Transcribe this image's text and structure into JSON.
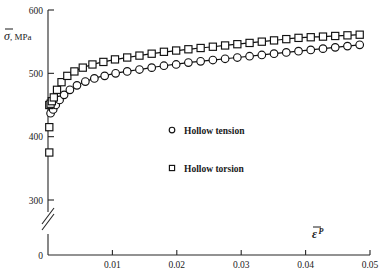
{
  "chart_data": {
    "type": "scatter",
    "title": "",
    "subtitle": "",
    "xlabel": "ε̄",
    "xlabel_superscript": "P",
    "ylabel": "σ̄",
    "ylabel_unit": "MPa",
    "grid": false,
    "legend_position": "center",
    "xlim": [
      0,
      0.05
    ],
    "ylim": [
      300,
      600
    ],
    "y_axis_break": true,
    "y_axis_break_note": "axis broken between 0 and 300",
    "xticks": [
      0.01,
      0.02,
      0.03,
      0.04,
      0.05
    ],
    "xtick_labels": [
      "0.01",
      "0.02",
      "0.03",
      "0.04",
      "0.05"
    ],
    "yticks": [
      300,
      400,
      500,
      600
    ],
    "ytick_labels": [
      "300",
      "400",
      "500",
      "600"
    ],
    "y_origin_label": "0",
    "series": [
      {
        "name": "Hollow tension",
        "marker": "circle",
        "x": [
          0.0004,
          0.0008,
          0.0012,
          0.0018,
          0.0025,
          0.0034,
          0.0045,
          0.0058,
          0.0072,
          0.0088,
          0.0105,
          0.0123,
          0.0142,
          0.0161,
          0.018,
          0.0199,
          0.0218,
          0.0237,
          0.0256,
          0.0275,
          0.0294,
          0.0313,
          0.0332,
          0.0351,
          0.037,
          0.0389,
          0.0408,
          0.0427,
          0.0446,
          0.0465,
          0.0484
        ],
        "y": [
          437,
          443,
          450,
          458,
          466,
          474,
          481,
          487,
          492,
          496,
          500,
          503,
          506,
          509,
          512,
          514,
          517,
          519,
          521,
          523,
          525,
          527,
          529,
          531,
          533,
          535,
          537,
          539,
          541,
          543,
          545
        ]
      },
      {
        "name": "Hollow torsion",
        "marker": "square",
        "x": [
          0.0002,
          0.0002,
          0.0002,
          0.0004,
          0.0006,
          0.0009,
          0.0014,
          0.0021,
          0.003,
          0.0041,
          0.0054,
          0.0069,
          0.0086,
          0.0104,
          0.0123,
          0.0142,
          0.0161,
          0.018,
          0.0199,
          0.0218,
          0.0237,
          0.0256,
          0.0275,
          0.0294,
          0.0313,
          0.0332,
          0.0351,
          0.037,
          0.0389,
          0.0408,
          0.0427,
          0.0446,
          0.0465,
          0.0484
        ],
        "y": [
          375,
          415,
          450,
          452,
          456,
          462,
          474,
          486,
          496,
          503,
          509,
          514,
          518,
          522,
          525,
          528,
          531,
          534,
          536,
          538,
          540,
          542,
          544,
          546,
          548,
          550,
          552,
          554,
          556,
          557,
          558,
          559,
          560,
          561
        ]
      }
    ],
    "fit_curves": [
      {
        "name": "Hollow tension fit",
        "x": [
          0.0004,
          0.0012,
          0.0025,
          0.0045,
          0.0072,
          0.0105,
          0.0142,
          0.018,
          0.0218,
          0.0256,
          0.0294,
          0.0332,
          0.037,
          0.0408,
          0.0446,
          0.0484
        ],
        "y": [
          437,
          450,
          466,
          481,
          492,
          500,
          506,
          512,
          517,
          521,
          525,
          529,
          533,
          537,
          541,
          545
        ]
      },
      {
        "name": "Hollow torsion fit",
        "x": [
          0.0002,
          0.0006,
          0.0014,
          0.003,
          0.0054,
          0.0086,
          0.0123,
          0.0161,
          0.0199,
          0.0237,
          0.0275,
          0.0313,
          0.0351,
          0.0389,
          0.0427,
          0.0465,
          0.0484
        ],
        "y": [
          450,
          456,
          474,
          496,
          509,
          518,
          525,
          531,
          536,
          540,
          544,
          548,
          552,
          556,
          558,
          560,
          561
        ]
      }
    ]
  }
}
